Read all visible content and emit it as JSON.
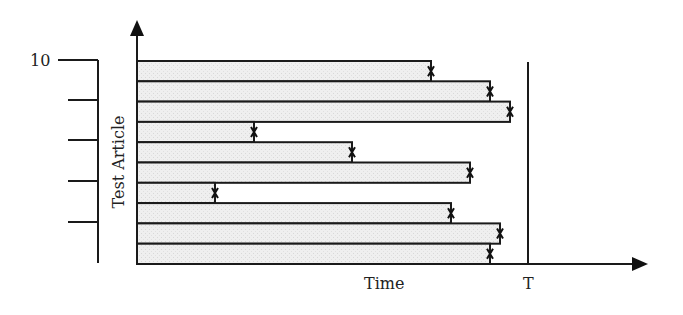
{
  "chart_data": {
    "type": "bar",
    "orientation": "horizontal",
    "title": "",
    "xlabel": "Time",
    "ylabel": "Test Article",
    "x_marker_label": "T",
    "y_scale_label": "10",
    "y_scale_ticks": 5,
    "categories": [
      "1",
      "2",
      "3",
      "4",
      "5",
      "6",
      "7",
      "8",
      "9",
      "10"
    ],
    "values_px_end": [
      431,
      490,
      510,
      254,
      352,
      470,
      215,
      451,
      500,
      490
    ],
    "values_relative_to_T": [
      0.75,
      0.9,
      0.96,
      0.3,
      0.55,
      0.85,
      0.2,
      0.8,
      0.93,
      0.9
    ],
    "T_value": 1.0,
    "xlim": [
      0,
      1.3
    ],
    "colors": {
      "bar_fill": "#ececec",
      "stroke": "#1a1a1a"
    }
  },
  "labels": {
    "y_axis": "Test Article",
    "x_axis": "Time",
    "t_marker": "T",
    "scale_top": "10"
  }
}
